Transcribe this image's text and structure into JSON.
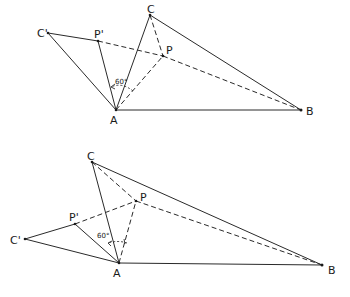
{
  "figures": [
    {
      "id": "top",
      "labels": {
        "A": "A",
        "B": "B",
        "C": "C",
        "P": "P",
        "C_prime": "C'",
        "P_prime": "P'",
        "angle": "60°"
      }
    },
    {
      "id": "bottom",
      "labels": {
        "A": "A",
        "B": "B",
        "C": "C",
        "P": "P",
        "C_prime": "C'",
        "P_prime": "P'",
        "angle": "60°"
      }
    }
  ]
}
